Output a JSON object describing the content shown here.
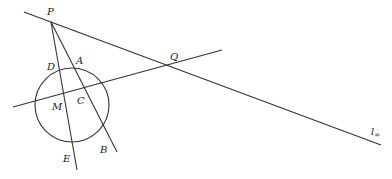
{
  "diagram": {
    "stroke_color": "#333333",
    "circle": {
      "cx": 72,
      "cy": 105,
      "r": 37
    },
    "lines": {
      "line_at_infinity": {
        "x1": 24,
        "y1": 12,
        "x2": 381,
        "y2": 145
      },
      "secant_mcq": {
        "x1": 13,
        "y1": 107,
        "x2": 222,
        "y2": 50
      },
      "line_p_e": {
        "x1": 51,
        "y1": 22,
        "x2": 77,
        "y2": 170
      },
      "line_p_b": {
        "x1": 51,
        "y1": 22,
        "x2": 117,
        "y2": 152
      }
    },
    "labels": {
      "P": "P",
      "Q": "Q",
      "A": "A",
      "D": "D",
      "M": "M",
      "C": "C",
      "E": "E",
      "B": "B",
      "l_inf_main": "l",
      "l_inf_sub": "∞"
    }
  }
}
